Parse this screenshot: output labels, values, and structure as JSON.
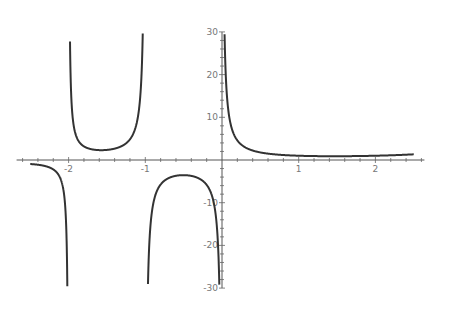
{
  "chart_data": {
    "type": "line",
    "title": "",
    "xlabel": "",
    "ylabel": "",
    "function": "Gamma(x)",
    "xlim": [
      -2.6,
      2.6
    ],
    "ylim": [
      -30,
      30
    ],
    "grid": false,
    "legend": null,
    "x_ticks": [
      -2,
      -1,
      1,
      2
    ],
    "x_tick_labels": [
      "-2",
      "-1",
      "1",
      "2"
    ],
    "y_ticks": [
      -30,
      -20,
      -10,
      10,
      20,
      30
    ],
    "y_tick_labels": [
      "-30",
      "-20",
      "-10",
      "10",
      "20",
      "30"
    ],
    "poles": [
      -2,
      -1,
      0
    ],
    "series": [
      {
        "name": "Gamma(x)",
        "color": "#333333",
        "domain": [
          -2.5,
          2.5
        ],
        "key_points": [
          {
            "x": -2.5,
            "y": -0.95
          },
          {
            "x": -1.5,
            "y": 2.36
          },
          {
            "x": -0.5,
            "y": -3.54
          },
          {
            "x": 0.5,
            "y": 1.77
          },
          {
            "x": 1.0,
            "y": 1.0
          },
          {
            "x": 1.46,
            "y": 0.886
          },
          {
            "x": 2.0,
            "y": 1.0
          },
          {
            "x": 2.5,
            "y": 1.33
          }
        ]
      }
    ]
  },
  "axes": {
    "origin_px": [
      222,
      160
    ],
    "x_scale_px_per_unit": 76.7,
    "y_scale_px_per_unit": 4.27
  }
}
